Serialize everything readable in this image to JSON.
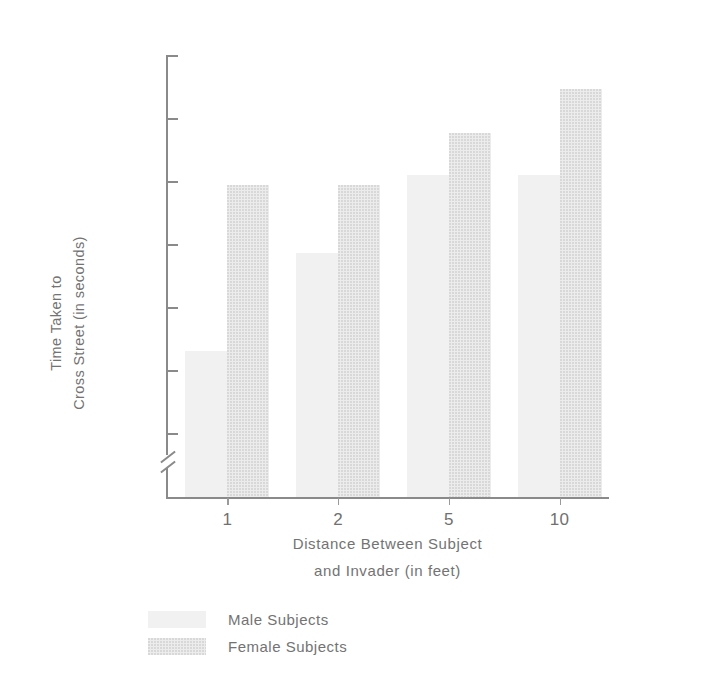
{
  "chart_data": {
    "type": "bar",
    "title": "",
    "subtitle": "",
    "xlabel": "Distance Between Subject and Invader (in feet)",
    "xlabel_lines": [
      "Distance Between Subject",
      "and Invader (in feet)"
    ],
    "ylabel": "Time Taken to Cross Street (in seconds)",
    "ylabel_lines": [
      "Time Taken to",
      "Cross Street (in seconds)"
    ],
    "categories": [
      "1",
      "2",
      "5",
      "10"
    ],
    "series": [
      {
        "name": "Male Subjects",
        "values": [
          7.65,
          8.43,
          9.05,
          9.05
        ],
        "color": "#f1f1f1"
      },
      {
        "name": "Female Subjects",
        "values": [
          8.97,
          8.97,
          9.38,
          9.73
        ],
        "color": "#ececec"
      }
    ],
    "ylim": [
      6.75,
      10.0
    ],
    "yticks": [
      "10.0",
      "9.5",
      "9.0",
      "8.5",
      "8.0",
      "7.5",
      "7.0"
    ],
    "ytick_values": [
      10.0,
      9.5,
      9.0,
      8.5,
      8.0,
      7.5,
      7.0
    ],
    "axis_break": true,
    "grid": false,
    "legend_position": "below"
  },
  "axes": {
    "y_tick_labels": [
      "10.0",
      "9.5",
      "9.0",
      "8.5",
      "8.0",
      "7.5",
      "7.0"
    ],
    "x_tick_labels": [
      "1",
      "2",
      "5",
      "10"
    ],
    "y_title_line1": "Time Taken to",
    "y_title_line2": "Cross Street (in seconds)",
    "x_title_line1": "Distance Between Subject",
    "x_title_line2": "and Invader (in feet)"
  },
  "legend": {
    "items": [
      {
        "label": "Male Subjects",
        "swatch": "male"
      },
      {
        "label": "Female Subjects",
        "swatch": "female"
      }
    ]
  },
  "colors": {
    "male_bar": "#f1f1f1",
    "female_bar": "#ececec",
    "axis": "#8a8a8a",
    "text": "#737373",
    "background": "#ffffff"
  }
}
